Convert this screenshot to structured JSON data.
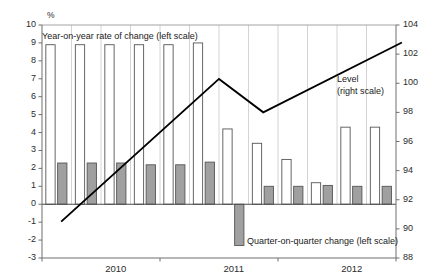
{
  "chart_data": {
    "type": "bar",
    "title": "",
    "subtitle": "",
    "unit_label": "%",
    "xlabel": "",
    "ylabel": "",
    "grid": false,
    "legend_position": "inside-annotations",
    "categories": [
      "2009Q4",
      "2010Q1",
      "2010Q2",
      "2010Q3",
      "2010Q4",
      "2011Q1",
      "2011Q2",
      "2011Q3",
      "2011Q4",
      "2012Q1",
      "2012Q2",
      "2012Q3"
    ],
    "axes": {
      "left": {
        "label": "%",
        "min": -3,
        "max": 10,
        "step": 1,
        "ticks": [
          10,
          9,
          8,
          7,
          6,
          5,
          4,
          3,
          2,
          1,
          0,
          -1,
          -2,
          -3
        ],
        "tick_labels": [
          "10",
          "9",
          "8",
          "7",
          "6",
          "5",
          "4",
          "3",
          "2",
          "1",
          "0",
          "-1",
          "-2",
          "-3"
        ]
      },
      "right": {
        "label": "",
        "min": 88,
        "max": 104,
        "step": 2,
        "ticks": [
          104,
          102,
          100,
          98,
          96,
          94,
          92,
          90,
          88
        ],
        "tick_labels": [
          "104",
          "102",
          "100",
          "98",
          "96",
          "94",
          "92",
          "90",
          "88"
        ]
      },
      "x": {
        "tick_labels": [
          "2010",
          "2011",
          "2012"
        ],
        "tick_positions": [
          2.5,
          6.5,
          10.5
        ]
      }
    },
    "series": [
      {
        "name": "Year-on-year rate of change (left scale)",
        "type": "bar",
        "scale": "left",
        "color": "#ffffff",
        "edge_color": "#555555",
        "values": [
          8.9,
          8.9,
          8.9,
          8.9,
          8.9,
          9.0,
          4.2,
          3.4,
          2.5,
          1.2,
          4.3,
          4.3
        ]
      },
      {
        "name": "Quarter-on-quarter change (left scale)",
        "type": "bar",
        "scale": "left",
        "color": "#a0a0a0",
        "edge_color": "#555555",
        "values": [
          2.3,
          2.3,
          2.3,
          2.2,
          2.2,
          2.35,
          -2.3,
          1.0,
          1.0,
          1.05,
          1.0,
          1.0
        ]
      },
      {
        "name": "Level (right scale)",
        "type": "line",
        "scale": "right",
        "color": "#000000",
        "x": [
          0.15,
          5.5,
          7.0,
          11.7
        ],
        "values": [
          90.5,
          100.3,
          98.0,
          102.8
        ]
      }
    ],
    "annotations": [
      {
        "name": "yoy-legend",
        "text": "Year-on-year  rate of change (left scale)",
        "x_px": 42,
        "y_px": 31
      },
      {
        "name": "level-legend-line1",
        "text": "Level",
        "x_px": 337,
        "y_px": 74
      },
      {
        "name": "level-legend-line2",
        "text": "(right scale)",
        "x_px": 337,
        "y_px": 86
      },
      {
        "name": "qoq-legend",
        "text": "Quarter-on-quarter  change (left scale)",
        "x_px": 247,
        "y_px": 236
      }
    ],
    "colors": {
      "bar_yoy_fill": "#ffffff",
      "bar_qoq_fill": "#a3a3a3",
      "bar_edge": "#5a5a5a",
      "line": "#000000",
      "axis": "#6e6e6e",
      "text": "#2b2b2b"
    }
  }
}
